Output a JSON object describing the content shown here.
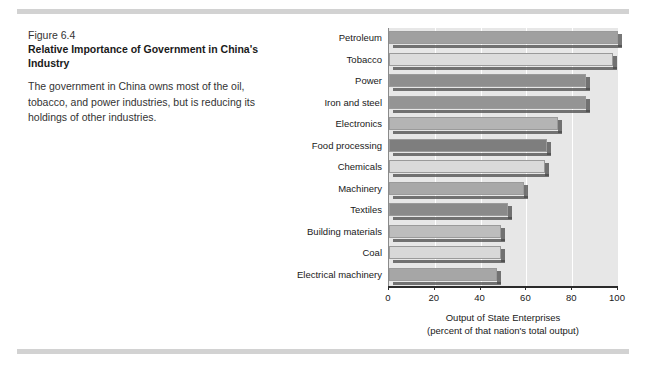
{
  "caption": {
    "figure_number": "Figure 6.4",
    "title": "Relative Importance of Government in China's Industry",
    "description": "The government in China owns most of the oil, tobacco, and power industries, but is reducing its holdings of other industries."
  },
  "chart_data": {
    "type": "bar",
    "orientation": "horizontal",
    "title": "Relative Importance of Government in China's Industry",
    "xlabel": "Output of State Enterprises",
    "xlabel_sub": "(percent of that nation's total output)",
    "ylabel": "",
    "xlim": [
      0,
      100
    ],
    "xticks": [
      "0",
      "20",
      "40",
      "60",
      "80",
      "100"
    ],
    "grid": true,
    "grid_color": "#ffffff",
    "legend": "none",
    "plot_background": "#e7e7e7",
    "categories": [
      "Petroleum",
      "Tobacco",
      "Power",
      "Iron and steel",
      "Electronics",
      "Food processing",
      "Chemicals",
      "Machinery",
      "Textiles",
      "Building materials",
      "Coal",
      "Electrical machinery"
    ],
    "values": [
      100,
      98,
      86,
      86,
      74,
      69,
      68,
      59,
      52,
      49,
      49,
      47
    ],
    "bar_colors": [
      "#a0a0a0",
      "#dcdcdc",
      "#8e8e8e",
      "#949494",
      "#b4b4b4",
      "#7e7e7e",
      "#dadada",
      "#a8a8a8",
      "#8a8a8a",
      "#bdbdbd",
      "#d8d8d8",
      "#a6a6a6"
    ]
  }
}
